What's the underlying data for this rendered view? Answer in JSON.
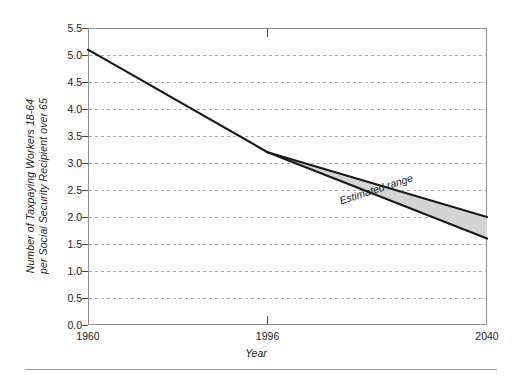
{
  "chart_data": {
    "type": "area",
    "title": "",
    "subtitle": "",
    "xlabel": "Year",
    "ylabel": "Number of Taxpaying Workers 18-64 per Social Security Recipient over 65",
    "ylabel_line1": "Number of Taxpaying Workers 18-64",
    "ylabel_line2": "per Social Security Recipient over 65",
    "xlim": [
      1960,
      2040
    ],
    "ylim": [
      0.0,
      5.5
    ],
    "x_ticks": [
      1960,
      1996,
      2040
    ],
    "x_tick_labels": [
      "1960",
      "1996",
      "2040"
    ],
    "y_ticks": [
      0.0,
      0.5,
      1.0,
      1.5,
      2.0,
      2.5,
      3.0,
      3.5,
      4.0,
      4.5,
      5.0,
      5.5
    ],
    "y_tick_labels": [
      "0.0",
      "0.5",
      "1.0",
      "1.5",
      "2.0",
      "2.5",
      "3.0",
      "3.5",
      "4.0",
      "4.5",
      "5.0",
      "5.5"
    ],
    "grid": "horizontal-dashed",
    "legend": "none",
    "series": [
      {
        "name": "Historical",
        "x": [
          1960,
          1996
        ],
        "values": [
          5.1,
          3.2
        ]
      },
      {
        "name": "Estimated range upper",
        "x": [
          1996,
          2040
        ],
        "values": [
          3.2,
          2.0
        ]
      },
      {
        "name": "Estimated range lower",
        "x": [
          1996,
          2040
        ],
        "values": [
          3.2,
          1.6
        ]
      }
    ],
    "annotations": [
      {
        "text": "Estimated range",
        "x": 2018,
        "y": 2.45,
        "rotation": -18,
        "style": "italic"
      }
    ],
    "colors": {
      "line": "#1a1a1a",
      "band_fill": "#d4d4d4",
      "grid": "#a9a9c4",
      "frame": "#8e8e8e",
      "text": "#1b1b1b",
      "rule": "#9a9a9a"
    }
  }
}
